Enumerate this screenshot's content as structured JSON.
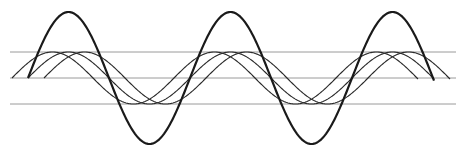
{
  "diagram": {
    "background": "#ffffff",
    "reference_lines": {
      "color": "#9a9a9a",
      "x_start": 10,
      "x_end": 456,
      "y_positions": [
        52,
        78,
        104
      ]
    },
    "midline_y": 78,
    "period_px": 162,
    "heavy_wave": {
      "color": "#1a1a1a",
      "stroke_width": 2.2,
      "x_start": 28,
      "x_end": 434,
      "amplitude_px": 66
    },
    "thin_waves": {
      "color": "#2a2a2a",
      "stroke_width": 1.1,
      "amplitude_px": 26,
      "items": [
        {
          "x_start": 12,
          "x_end": 418
        },
        {
          "x_start": 28,
          "x_end": 434
        },
        {
          "x_start": 44,
          "x_end": 450
        }
      ]
    }
  }
}
